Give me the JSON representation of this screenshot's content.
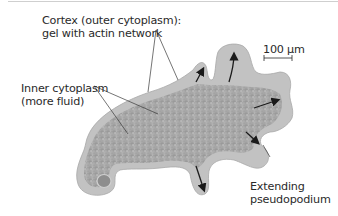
{
  "figure": {
    "labels": {
      "cortex_line1": "Cortex (outer cytoplasm):",
      "cortex_line2": "gel with actin network",
      "inner_line1": "Inner cytoplasm",
      "inner_line2": "(more fluid)",
      "pseudo_line1": "Extending",
      "pseudo_line2": "pseudopodium"
    },
    "scale_bar": {
      "label": "100 µm"
    },
    "colors": {
      "cell_fill": "#a9a9a9",
      "cell_edge": "#c4c4c4",
      "cortex": "#bdbdbd",
      "arrows": "#1a1a1a",
      "text": "#2a2a2a",
      "leader_lines": "#3a3a3a"
    },
    "arrows": [
      {
        "name": "small-top-left-pseudopod",
        "direction": "up-right"
      },
      {
        "name": "top-pseudopod",
        "direction": "up"
      },
      {
        "name": "right-pseudopod",
        "direction": "right"
      },
      {
        "name": "lower-right-pseudopod",
        "direction": "down-right"
      },
      {
        "name": "bottom-pseudopod",
        "direction": "down"
      }
    ]
  }
}
